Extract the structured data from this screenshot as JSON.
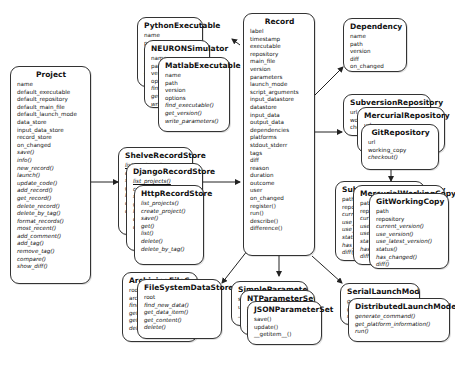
{
  "diagram": {
    "type": "uml-class-diagram",
    "classes": {
      "project": {
        "name": "Project",
        "attributes": [
          "name",
          "default_executable",
          "default_repository",
          "default_main_file",
          "default_launch_mode",
          "data_store",
          "input_data_store",
          "record_store",
          "on_changed"
        ],
        "operations": [
          "save()",
          "info()",
          "new_record()",
          "launch()",
          "update_code()",
          "add_record()",
          "get_record()",
          "delete_record()",
          "delete_by_tag()",
          "format_records()",
          "most_recent()",
          "add_comment()",
          "add_tag()",
          "remove_tag()",
          "compare()",
          "show_diff()"
        ]
      },
      "python_executable": {
        "name": "PythonExecutable",
        "attributes": [
          "name",
          "path",
          "version",
          "options"
        ],
        "operations": [
          "find_executable()",
          "get_version()",
          "write_parameters()"
        ]
      },
      "neuron_simulator": {
        "name": "NEURONSimulator",
        "attributes": [
          "name",
          "path",
          "version",
          "options"
        ],
        "operations": [
          "find_executable()",
          "get_version()",
          "write_parameters()"
        ]
      },
      "matlab_executable": {
        "name": "MatlabExecutable",
        "attributes": [
          "name",
          "path",
          "version",
          "options"
        ],
        "operations": [
          "find_executable()",
          "get_version()",
          "write_parameters()"
        ]
      },
      "record": {
        "name": "Record",
        "attributes": [
          "label",
          "timestamp",
          "executable",
          "repository",
          "main_file",
          "version",
          "parameters",
          "launch_mode",
          "script_arguments",
          "input_datastore",
          "datastore",
          "input_data",
          "output_data",
          "dependencies",
          "platforms",
          "stdout_stderr",
          "tags",
          "diff",
          "reason",
          "duration",
          "outcome",
          "user",
          "on_changed"
        ],
        "operations": [
          "register()",
          "run()",
          "describe()",
          "difference()"
        ]
      },
      "dependency": {
        "name": "Dependency",
        "attributes": [
          "name",
          "path",
          "version",
          "diff",
          "on_changed"
        ],
        "operations": []
      },
      "subversion_repository": {
        "name": "SubversionRepository",
        "attributes": [
          "url",
          "working_copy"
        ],
        "operations": [
          "checkout()"
        ]
      },
      "mercurial_repository": {
        "name": "MercurialRepository",
        "attributes": [
          "url",
          "working_copy"
        ],
        "operations": [
          "checkout()"
        ]
      },
      "git_repository": {
        "name": "GitRepository",
        "attributes": [
          "url",
          "working_copy"
        ],
        "operations": [
          "checkout()"
        ]
      },
      "subversion_working_copy": {
        "name": "SubversionWorkingCopy",
        "attributes": [
          "path",
          "repository"
        ],
        "operations": [
          "current_version()",
          "use_version()",
          "use_latest_version()",
          "status()",
          "has_changed()",
          "diff()"
        ]
      },
      "mercurial_working_copy": {
        "name": "MercurialWorkingCopy",
        "attributes": [
          "path",
          "repository"
        ],
        "operations": [
          "current_version()",
          "use_version()",
          "use_latest_version()",
          "status()",
          "has_changed()",
          "diff()"
        ]
      },
      "git_working_copy": {
        "name": "GitWorkingCopy",
        "attributes": [
          "path",
          "repository"
        ],
        "operations": [
          "current_version()",
          "use_version()",
          "use_latest_version()",
          "status()",
          "has_changed()",
          "diff()"
        ]
      },
      "shelve_record_store": {
        "name": "ShelveRecordStore",
        "attributes": [],
        "operations": [
          "list_projects()",
          "create_project()",
          "save()",
          "get()",
          "list()",
          "delete()",
          "delete_by_tag()"
        ]
      },
      "django_record_store": {
        "name": "DjangoRecordStore",
        "attributes": [],
        "operations": [
          "list_projects()",
          "create_project()",
          "save()",
          "get()",
          "list()",
          "delete()",
          "delete_by_tag()"
        ]
      },
      "http_record_store": {
        "name": "HttpRecordStore",
        "attributes": [],
        "operations": [
          "list_projects()",
          "create_project()",
          "save()",
          "get()",
          "list()",
          "delete()",
          "delete_by_tag()"
        ]
      },
      "archiving_file_system_data_store": {
        "name": "ArchivingFileSystemDataStore",
        "attributes": [
          "root",
          "archive_store"
        ],
        "operations": [
          "find_new_data()",
          "get_data_item()",
          "get_content()",
          "delete()"
        ]
      },
      "file_system_data_store": {
        "name": "FileSystemDataStore",
        "attributes": [
          "root"
        ],
        "operations": [
          "find_new_data()",
          "get_data_item()",
          "get_content()",
          "delete()"
        ]
      },
      "simple_parameter_set": {
        "name": "SimpleParameterSet",
        "attributes": [],
        "operations": [
          "save()",
          "update()",
          "__getitem__()"
        ]
      },
      "nt_parameter_set": {
        "name": "NTParameterSet",
        "attributes": [],
        "operations": [
          "save()",
          "update()",
          "__getitem__()"
        ]
      },
      "json_parameter_set": {
        "name": "JSONParameterSet",
        "attributes": [],
        "operations": [
          "save()",
          "update()",
          "__getitem__()"
        ]
      },
      "serial_launch_mode": {
        "name": "SerialLaunchMode",
        "attributes": [],
        "operations": [
          "generate_command()",
          "get_platform_information()",
          "run()"
        ]
      },
      "distributed_launch_mode": {
        "name": "DistributedLaunchMode",
        "attributes": [],
        "operations": [
          "generate_command()",
          "get_platform_information()",
          "run()"
        ]
      }
    },
    "connections": [
      {
        "from": "project",
        "to": "shelve_record_store"
      },
      {
        "from": "shelve_record_store",
        "to": "record"
      },
      {
        "from": "record",
        "to": "python_executable"
      },
      {
        "from": "record",
        "to": "dependency"
      },
      {
        "from": "record",
        "to": "subversion_repository"
      },
      {
        "from": "git_repository",
        "to": "subversion_working_copy"
      },
      {
        "from": "record",
        "to": "file_system_data_store"
      },
      {
        "from": "record",
        "to": "simple_parameter_set"
      },
      {
        "from": "record",
        "to": "serial_launch_mode"
      }
    ]
  }
}
